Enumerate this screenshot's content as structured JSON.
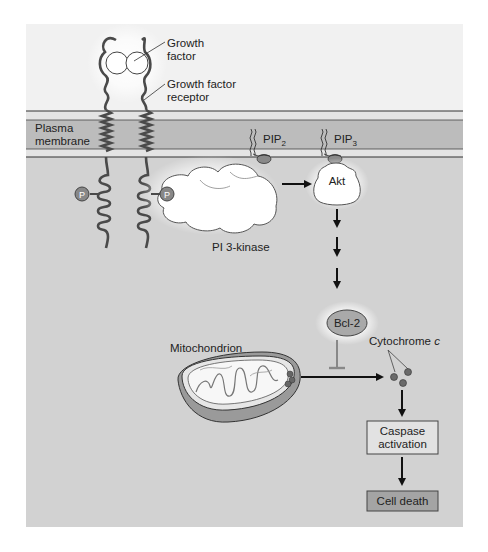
{
  "labels": {
    "growth_factor_1": "Growth",
    "growth_factor_2": "factor",
    "receptor_1": "Growth factor",
    "receptor_2": "receptor",
    "membrane_1": "Plasma",
    "membrane_2": "membrane",
    "pip2": "PIP",
    "pip2_sub": "2",
    "pip3": "PIP",
    "pip3_sub": "3",
    "pi3k": "PI 3-kinase",
    "akt": "Akt",
    "phospho": "P",
    "bcl2": "Bcl-2",
    "mitochondrion": "Mitochondrion",
    "cytochrome": "Cytochrome ",
    "cytochrome_c": "c",
    "caspase_1": "Caspase",
    "caspase_2": "activation",
    "cell_death": "Cell death"
  },
  "colors": {
    "background": "#ffffff",
    "extracellular": "#f1f1f1",
    "cytoplasm": "#d2d2d2",
    "membrane_light": "#e4e4e4",
    "membrane_dark": "#bcbcbc",
    "protein_white": "#ffffff",
    "bcl2_fill": "#a9a9a9",
    "box_fill": "#e2e2e2",
    "cell_death_fill": "#a4a4a4",
    "arrow": "#111111",
    "dots": "#6a6a6a"
  }
}
